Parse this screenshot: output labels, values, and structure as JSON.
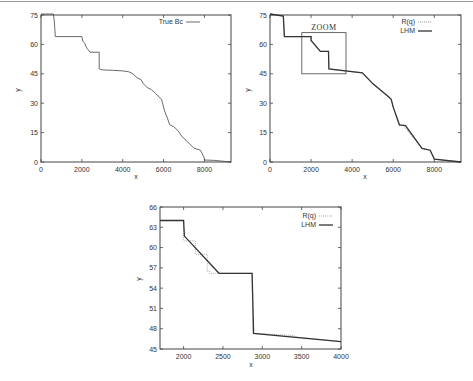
{
  "chart_data": [
    {
      "type": "line",
      "id": "panel-true-bc",
      "title": "",
      "xlabel": "x",
      "ylabel": "y",
      "xlim": [
        0,
        9300
      ],
      "ylim": [
        0,
        75
      ],
      "xticks": [
        0,
        2000,
        4000,
        6000,
        8000
      ],
      "yticks": [
        0,
        15,
        30,
        45,
        60,
        75
      ],
      "legend": {
        "position": "top-right",
        "entries": [
          "True Bc"
        ]
      },
      "series": [
        {
          "name": "True Bc",
          "style": "solid-thin",
          "x": [
            0,
            600,
            650,
            700,
            2000,
            2050,
            2150,
            2200,
            2250,
            2400,
            2850,
            2850,
            3000,
            3500,
            4000,
            4300,
            4500,
            4700,
            4900,
            5000,
            5200,
            5400,
            5600,
            5800,
            5900,
            6000,
            6050,
            6200,
            6300,
            6500,
            6700,
            6900,
            7100,
            7300,
            7500,
            7800,
            8000,
            8000,
            8500,
            9000,
            9300
          ],
          "y": [
            75.5,
            75.5,
            72,
            64,
            64,
            61.5,
            60.5,
            59,
            58,
            56,
            56,
            47.5,
            47,
            46.8,
            46.5,
            46,
            45,
            43,
            42,
            40,
            38,
            37,
            35,
            33,
            32,
            28,
            26,
            22,
            19,
            18,
            16,
            13,
            11,
            9,
            7,
            6,
            2,
            1,
            0.8,
            0.3,
            0
          ]
        }
      ]
    },
    {
      "type": "line",
      "id": "panel-rq-lhm",
      "title": "",
      "xlabel": "x",
      "ylabel": "y",
      "xlim": [
        0,
        9300
      ],
      "ylim": [
        0,
        75
      ],
      "xticks": [
        0,
        2000,
        4000,
        6000,
        8000
      ],
      "yticks": [
        0,
        15,
        30,
        45,
        60,
        75
      ],
      "legend": {
        "position": "top-right",
        "entries": [
          "R(q)",
          "LHM"
        ]
      },
      "annotation": {
        "text": "ZOOM",
        "box_x": [
          1550,
          3700
        ],
        "box_y": [
          45,
          66
        ]
      },
      "series": [
        {
          "name": "R(q)",
          "style": "dotted",
          "x": [
            0,
            650,
            700,
            2000,
            2000,
            2300,
            2450,
            2850,
            2870,
            3500,
            4500,
            5000,
            5800,
            5900,
            6000,
            6300,
            6500,
            7400,
            7800,
            8000,
            9300
          ],
          "y": [
            75.5,
            74.5,
            64,
            64,
            62,
            58.5,
            56.5,
            56.5,
            47.5,
            46.6,
            45.5,
            40,
            33,
            32,
            28,
            19,
            18.5,
            7,
            6,
            1.5,
            0
          ]
        },
        {
          "name": "LHM",
          "style": "solid-thick",
          "x": [
            0,
            650,
            700,
            2000,
            2000,
            2450,
            2850,
            2870,
            4500,
            5000,
            5800,
            5900,
            6000,
            6300,
            6600,
            7400,
            7800,
            8000,
            9300
          ],
          "y": [
            75.5,
            74.5,
            64,
            64,
            62,
            56.5,
            56.5,
            47.5,
            45.5,
            40,
            33,
            32,
            28,
            19,
            18.5,
            7,
            6,
            1.5,
            0
          ]
        }
      ]
    },
    {
      "type": "line",
      "id": "panel-zoom",
      "title": "",
      "xlabel": "x",
      "ylabel": "y",
      "xlim": [
        1700,
        4000
      ],
      "ylim": [
        45,
        66
      ],
      "xticks": [
        2000,
        2500,
        3000,
        3500,
        4000
      ],
      "yticks": [
        45,
        48,
        51,
        54,
        57,
        60,
        63,
        66
      ],
      "legend": {
        "position": "top-right",
        "entries": [
          "R(q)",
          "LHM"
        ]
      },
      "series": [
        {
          "name": "R(q)",
          "style": "dotted",
          "x": [
            1700,
            2000,
            2000,
            2150,
            2150,
            2300,
            2300,
            2330,
            2330,
            2450,
            2870,
            2880,
            3400,
            3400,
            4000
          ],
          "y": [
            64,
            64,
            61,
            61,
            59,
            59,
            56.5,
            56.5,
            56.2,
            56.2,
            56.2,
            47.3,
            47.0,
            46.8,
            46.1
          ]
        },
        {
          "name": "LHM",
          "style": "solid-thick",
          "x": [
            1700,
            2000,
            2010,
            2450,
            2870,
            2890,
            4000
          ],
          "y": [
            64,
            64,
            61.7,
            56.2,
            56.2,
            47.3,
            46.1
          ]
        }
      ]
    }
  ],
  "panels": {
    "a": {
      "legend_label": "True Bc",
      "xlabel": "x",
      "ylabel": "y",
      "xtick_labels": [
        "0",
        "2000",
        "4000",
        "6000",
        "8000"
      ],
      "ytick_labels": [
        "0",
        "15",
        "30",
        "45",
        "60",
        "75"
      ]
    },
    "b": {
      "legend_labels": [
        "R(q)",
        "LHM"
      ],
      "zoom_label": "ZOOM",
      "xlabel": "x",
      "ylabel": "y",
      "xtick_labels": [
        "0",
        "2000",
        "4000",
        "6000",
        "8000"
      ],
      "ytick_labels": [
        "0",
        "15",
        "30",
        "45",
        "60",
        "75"
      ]
    },
    "c": {
      "legend_labels": [
        "R(q)",
        "LHM"
      ],
      "xlabel": "x",
      "ylabel": "y",
      "xtick_labels": [
        "2000",
        "2500",
        "3000",
        "3500",
        "4000"
      ],
      "ytick_labels": [
        "45",
        "48",
        "51",
        "54",
        "57",
        "60",
        "63",
        "66"
      ]
    }
  },
  "colors": {
    "line": "#333333",
    "axis": "#444444",
    "background": "#ffffff"
  }
}
